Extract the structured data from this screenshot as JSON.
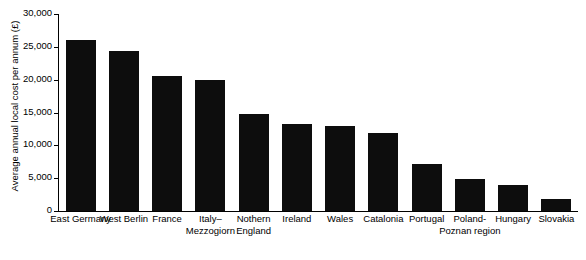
{
  "chart_data": {
    "type": "bar",
    "title": "",
    "xlabel": "",
    "ylabel": "Average annual local cost per annum (£)",
    "ylim": [
      0,
      30000
    ],
    "ytick_step": 5000,
    "grid": false,
    "legend": null,
    "bar_color": "#0d0d0d",
    "axis_color": "#000000",
    "categories": [
      "East Germany",
      "West Berlin",
      "France",
      "Italy–Mezzogiorn",
      "Nothern England",
      "Ireland",
      "Wales",
      "Catalonia",
      "Portugal",
      "Poland-Poznan region",
      "Hungary",
      "Slovakia"
    ],
    "values": [
      26000,
      24300,
      20500,
      19900,
      14800,
      13300,
      13000,
      11900,
      7200,
      4900,
      3900,
      1800
    ],
    "yticks": [
      0,
      5000,
      10000,
      15000,
      20000,
      25000,
      30000
    ],
    "ytick_labels": [
      "0",
      "5,000",
      "10,000",
      "15,000",
      "20,000",
      "25,000",
      "30,000"
    ]
  }
}
